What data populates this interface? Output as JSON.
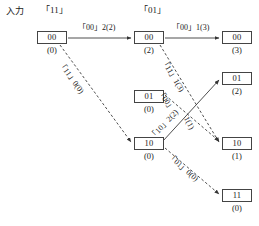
{
  "diagram": {
    "stroke_color": "#444444",
    "text_color": "#1a1a1a"
  },
  "headers": [
    {
      "id": "input-label",
      "text": "入力",
      "x": 6,
      "y": 6
    },
    {
      "id": "stage1-label",
      "text": "「11」",
      "x": 41,
      "y": 5
    },
    {
      "id": "stage2-label",
      "text": "「01」",
      "x": 139,
      "y": 5
    }
  ],
  "nodes": [
    {
      "id": "n-c1-00",
      "state": "00",
      "metric": "(0)",
      "x": 37,
      "y": 31,
      "column": 1
    },
    {
      "id": "n-c2-00",
      "state": "00",
      "metric": "(2)",
      "x": 134,
      "y": 31,
      "column": 2
    },
    {
      "id": "n-c2-01",
      "state": "01",
      "metric": "(0)",
      "x": 134,
      "y": 90,
      "column": 2
    },
    {
      "id": "n-c2-10",
      "state": "10",
      "metric": "(0)",
      "x": 134,
      "y": 137,
      "column": 2
    },
    {
      "id": "n-c3-00",
      "state": "00",
      "metric": "(3)",
      "x": 222,
      "y": 31,
      "column": 3
    },
    {
      "id": "n-c3-01",
      "state": "01",
      "metric": "(2)",
      "x": 222,
      "y": 72,
      "column": 3
    },
    {
      "id": "n-c3-10",
      "state": "10",
      "metric": "(1)",
      "x": 222,
      "y": 137,
      "column": 3
    },
    {
      "id": "n-c3-11",
      "state": "11",
      "metric": "(0)",
      "x": 222,
      "y": 189,
      "column": 3
    }
  ],
  "edges": [
    {
      "id": "e-c1-00-to-c2-00",
      "from": "n-c1-00",
      "to": "n-c2-00",
      "style": "solid",
      "x1": 68,
      "y1": 38,
      "x2": 131,
      "y2": 38
    },
    {
      "id": "e-c1-00-to-c2-10",
      "from": "n-c1-00",
      "to": "n-c2-10",
      "style": "dashed",
      "x1": 60,
      "y1": 45,
      "x2": 131,
      "y2": 142
    },
    {
      "id": "e-c2-00-to-c3-00",
      "from": "n-c2-00",
      "to": "n-c3-00",
      "style": "solid",
      "x1": 165,
      "y1": 38,
      "x2": 219,
      "y2": 38
    },
    {
      "id": "e-c2-00-to-c3-10",
      "from": "n-c2-00",
      "to": "n-c3-10",
      "style": "dashed",
      "x1": 160,
      "y1": 45,
      "x2": 219,
      "y2": 142
    },
    {
      "id": "e-c2-01-to-c3-10",
      "from": "n-c2-01",
      "to": "n-c3-10",
      "style": "dashed",
      "x1": 165,
      "y1": 95,
      "x2": 219,
      "y2": 141
    },
    {
      "id": "e-c2-10-to-c3-01",
      "from": "n-c2-10",
      "to": "n-c3-01",
      "style": "solid",
      "x1": 163,
      "y1": 141,
      "x2": 219,
      "y2": 80
    },
    {
      "id": "e-c2-10-to-c3-11",
      "from": "n-c2-10",
      "to": "n-c3-11",
      "style": "dashed",
      "x1": 165,
      "y1": 148,
      "x2": 219,
      "y2": 194
    }
  ],
  "edge_labels": [
    {
      "id": "lbl-00-2",
      "text": "「00」2(2)",
      "x": 78,
      "y": 23,
      "rotate": 0
    },
    {
      "id": "lbl-11-0",
      "text": "「11」0(0)",
      "x": 64,
      "y": 60,
      "rotate": 54
    },
    {
      "id": "lbl-00-1",
      "text": "「00」1(3)",
      "x": 172,
      "y": 23,
      "rotate": 0
    },
    {
      "id": "lbl-11-1",
      "text": "「11」1(3)",
      "x": 167,
      "y": 57,
      "rotate": 59
    },
    {
      "id": "lbl-00-bis",
      "text": "「00」",
      "x": 163,
      "y": 88,
      "rotate": 56
    },
    {
      "id": "lbl-10-2",
      "text": "「10」2(2)",
      "x": 148,
      "y": 135,
      "rotate": -47
    },
    {
      "id": "lbl-1-1",
      "text": "1(1)",
      "x": 190,
      "y": 115,
      "rotate": 62
    },
    {
      "id": "lbl-01-0",
      "text": "「01」0(0)",
      "x": 172,
      "y": 152,
      "rotate": 41
    }
  ]
}
